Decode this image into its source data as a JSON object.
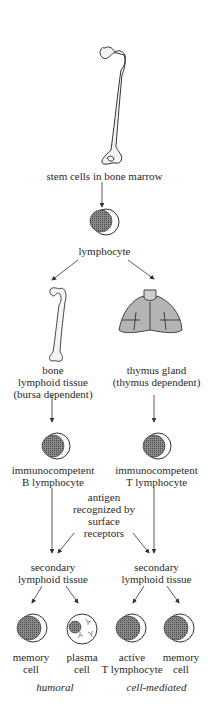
{
  "diagram": {
    "colors": {
      "ink": "#333333",
      "bone_fill": "#f4f4f4",
      "thymus_fill": "#b4b4b4",
      "cell_dot": "#6a6a6a"
    },
    "nodes": {
      "stem": {
        "label": "stem cells in bone marrow",
        "icon": "femur-icon"
      },
      "lymphocyte": {
        "label": "lymphocyte",
        "icon": "lymphocyte-cell-icon"
      },
      "bone": {
        "line1": "bone",
        "line2": "lymphoid tissue",
        "line3": "(bursa dependent)",
        "icon": "bone-icon"
      },
      "thymus": {
        "line1": "thymus gland",
        "line2": "(thymus dependent)",
        "icon": "thymus-icon"
      },
      "b_cell": {
        "line1": "immunocompetent",
        "line2": "B lymphocyte",
        "icon": "b-lymphocyte-icon"
      },
      "t_cell": {
        "line1": "immunocompetent",
        "line2": "T lymphocyte",
        "icon": "t-lymphocyte-icon"
      },
      "antigen": {
        "line1": "antigen",
        "line2": "recognized by",
        "line3": "surface",
        "line4": "receptors"
      },
      "secondary_left": {
        "line1": "secondary",
        "line2": "lymphoid tissue"
      },
      "secondary_right": {
        "line1": "secondary",
        "line2": "lymphoid  tissue"
      },
      "memory_left": {
        "line1": "memory",
        "line2": "cell",
        "icon": "memory-cell-icon"
      },
      "plasma": {
        "line1": "plasma",
        "line2": "cell",
        "icon": "plasma-cell-icon"
      },
      "active_t": {
        "line1": "active",
        "line2": "T lymphocyte",
        "icon": "active-t-lymphocyte-icon"
      },
      "memory_right": {
        "line1": "memory",
        "line2": "cell",
        "icon": "memory-cell-icon"
      }
    },
    "pathways": {
      "left": "humoral",
      "right": "cell-mediated"
    }
  }
}
